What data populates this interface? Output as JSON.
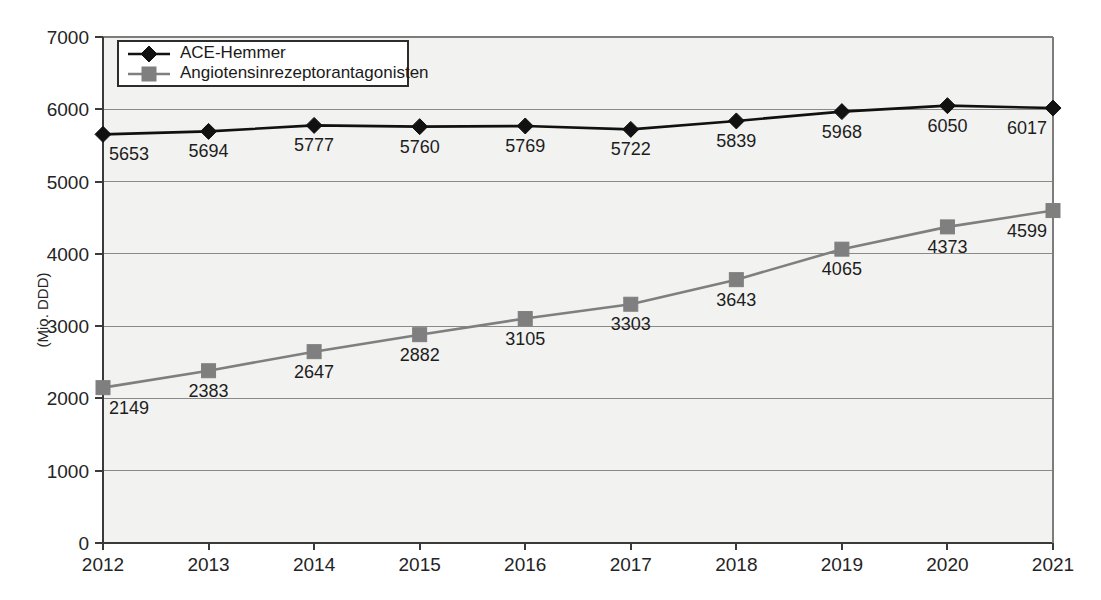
{
  "chart_data": {
    "type": "line",
    "title": "",
    "xlabel": "",
    "ylabel": "(Mio. DDD)",
    "categories": [
      "2012",
      "2013",
      "2014",
      "2015",
      "2016",
      "2017",
      "2018",
      "2019",
      "2020",
      "2021"
    ],
    "ylim": [
      0,
      7000
    ],
    "y_ticks": [
      "0",
      "1000",
      "2000",
      "3000",
      "4000",
      "5000",
      "6000",
      "7000"
    ],
    "grid": true,
    "legend_position": "top-left",
    "series": [
      {
        "name": "ACE-Hemmer",
        "marker": "diamond",
        "color": "#111111",
        "values": [
          5653,
          5694,
          5777,
          5760,
          5769,
          5722,
          5839,
          5968,
          6050,
          6017
        ],
        "labels": [
          "5653",
          "5694",
          "5777",
          "5760",
          "5769",
          "5722",
          "5839",
          "5968",
          "6050",
          "6017"
        ]
      },
      {
        "name": "Angiotensinrezeptorantagonisten",
        "marker": "square",
        "color": "#7f7f7f",
        "values": [
          2149,
          2383,
          2647,
          2882,
          3105,
          3303,
          3643,
          4065,
          4373,
          4599
        ],
        "labels": [
          "2149",
          "2383",
          "2647",
          "2882",
          "3105",
          "3303",
          "3643",
          "4065",
          "4373",
          "4599"
        ]
      }
    ]
  },
  "legend": {
    "entries": [
      {
        "label": "ACE-Hemmer",
        "marker": "diamond",
        "color": "#111111"
      },
      {
        "label": "Angiotensinrezeptorantagonisten",
        "marker": "square",
        "color": "#7f7f7f"
      }
    ]
  },
  "colors": {
    "plot_background": "#f2f2f0",
    "page_background": "#ffffff",
    "gridline": "#8a8a8a",
    "axis": "#3a3a3a",
    "series_ace": "#111111",
    "series_arb": "#7f7f7f",
    "text": "#1a1a1a"
  }
}
